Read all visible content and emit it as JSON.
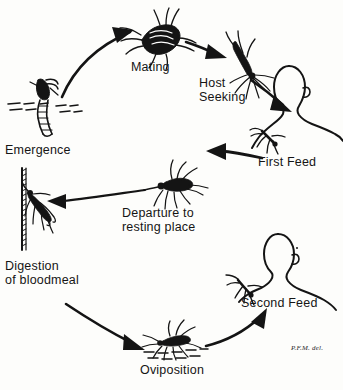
{
  "diagram": {
    "ink_color": "#141414",
    "background_color": "#fdfdfb",
    "stages": [
      {
        "id": "emergence",
        "label": "Emergence",
        "label_lines": [
          "Emergence"
        ],
        "icon": "pupa-emerging-from-water-icon"
      },
      {
        "id": "mating",
        "label": "Mating",
        "label_lines": [
          "Mating"
        ],
        "icon": "mating-mosquito-pair-icon"
      },
      {
        "id": "host-seeking",
        "label": "Host Seeking",
        "label_lines": [
          "Host",
          "Seeking"
        ],
        "icon": "flying-mosquito-icon"
      },
      {
        "id": "first-feed",
        "label": "First Feed",
        "label_lines": [
          "First Feed"
        ],
        "icon": "mosquito-feeding-on-human-icon"
      },
      {
        "id": "departure-to-resting-place",
        "label": "Departure to resting place",
        "label_lines": [
          "Departure to",
          "resting place"
        ],
        "icon": "engorged-mosquito-flying-icon"
      },
      {
        "id": "digestion-of-bloodmeal",
        "label": "Digestion of bloodmeal",
        "label_lines": [
          "Digestion",
          "of bloodmeal"
        ],
        "icon": "mosquito-resting-on-wall-icon"
      },
      {
        "id": "oviposition",
        "label": "Oviposition",
        "label_lines": [
          "Oviposition"
        ],
        "icon": "mosquito-laying-eggs-on-water-icon"
      },
      {
        "id": "second-feed",
        "label": "Second Feed",
        "label_lines": [
          "Second Feed"
        ],
        "icon": "mosquito-feeding-on-second-human-icon"
      }
    ],
    "figures": [
      {
        "id": "human-head-first",
        "name": "human-head-profile-upper"
      },
      {
        "id": "human-head-second",
        "name": "human-head-profile-lower"
      }
    ],
    "signature": "P.F.M. del."
  }
}
